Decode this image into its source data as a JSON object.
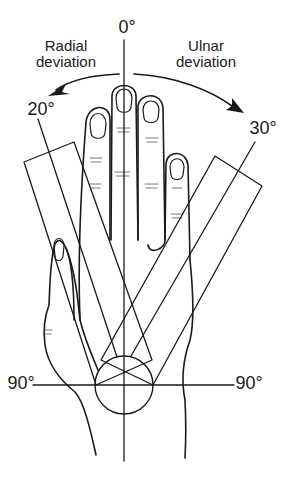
{
  "figure": {
    "labels": {
      "top_angle": "0°",
      "radial_label": "Radial\ndeviation",
      "ulnar_label": "Ulnar\ndeviation",
      "radial_angle": "20°",
      "ulnar_angle": "30°",
      "left_horizontal_angle": "90°",
      "right_horizontal_angle": "90°"
    },
    "colors": {
      "line": "#1a1a1a",
      "background": "#ffffff"
    }
  }
}
